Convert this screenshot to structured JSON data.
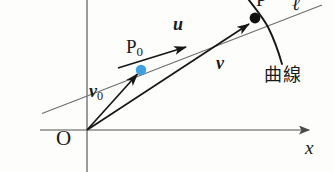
{
  "figure": {
    "type": "vector-geometry-diagram",
    "background_color": "#fdfdfc",
    "width": 334,
    "height": 172,
    "labels": {
      "origin": "O",
      "x_axis": "x",
      "point_p0": "P",
      "point_p0_sub": "0",
      "point_p": "P",
      "line_l": "ℓ",
      "vector_u": "u",
      "vector_v": "v",
      "vector_v0": "v",
      "vector_v0_sub": "0",
      "curve_jp": "曲線"
    },
    "colors": {
      "axis": "#8a8a8a",
      "line_l": "#6f6f6f",
      "vector": "#171717",
      "curve": "#171717",
      "point_p0_fill": "#3fa0e0",
      "point_p_fill": "#111111",
      "label": "#1a1a1a"
    },
    "geometry": {
      "origin": [
        87,
        130
      ],
      "x_axis_start": [
        40,
        130
      ],
      "x_axis_end": [
        312,
        130
      ],
      "y_axis_top": [
        87,
        0
      ],
      "y_axis_bottom": [
        87,
        172
      ],
      "line_l_start": [
        42,
        113
      ],
      "line_l_end": [
        318,
        6
      ],
      "point_p0": [
        141,
        70
      ],
      "point_p": [
        255,
        18
      ],
      "vector_u_arrow_tip": [
        191,
        45
      ],
      "curve_top": [
        250,
        0
      ],
      "curve_bottom": [
        281,
        62
      ]
    }
  }
}
